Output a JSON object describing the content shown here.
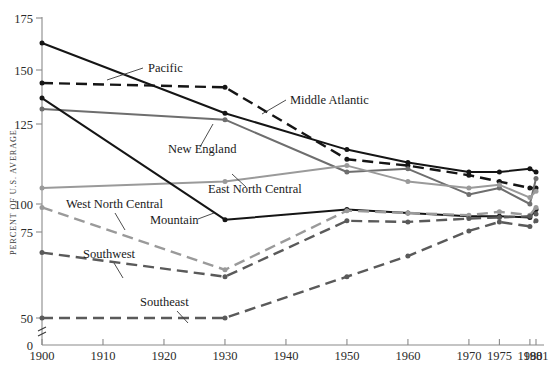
{
  "chart_data": {
    "type": "line",
    "title": "",
    "xlabel": "",
    "ylabel": "PERCENT OF U.S. AVERAGE",
    "x": [
      1900,
      1910,
      1920,
      1930,
      1940,
      1950,
      1960,
      1970,
      1975,
      1980,
      1981
    ],
    "xtick_labels": [
      "1900",
      "1910",
      "1920",
      "1930",
      "1940",
      "1950",
      "1960",
      "1970",
      "1975",
      "1980",
      "1981"
    ],
    "ytick_labels": [
      "0",
      "50",
      "75",
      "100",
      "125",
      "150",
      "175"
    ],
    "ytick_values": [
      0,
      50,
      75,
      100,
      125,
      150,
      175
    ],
    "ylim": [
      44,
      175
    ],
    "axis_break": true,
    "grid": false,
    "legend": "inline-annotations",
    "series": [
      {
        "name": "Pacific",
        "color": "#151515",
        "style": "solid",
        "x": [
          1900,
          1930,
          1950,
          1960,
          1970,
          1975,
          1980,
          1981
        ],
        "values": [
          163,
          130,
          117,
          113,
          110,
          110,
          111,
          110
        ]
      },
      {
        "name": "Middle Atlantic",
        "color": "#151515",
        "style": "dashed",
        "x": [
          1900,
          1930,
          1950,
          1960,
          1970,
          1975,
          1980,
          1981
        ],
        "values": [
          144,
          142,
          114,
          112,
          109,
          107,
          105,
          105
        ]
      },
      {
        "name": "New England",
        "color": "#6e6e6e",
        "style": "solid",
        "x": [
          1900,
          1930,
          1950,
          1960,
          1970,
          1975,
          1980,
          1981
        ],
        "values": [
          132,
          127,
          110,
          111,
          103,
          105,
          100,
          108
        ]
      },
      {
        "name": "East North Central",
        "color": "#9a9a9a",
        "style": "solid",
        "x": [
          1900,
          1930,
          1950,
          1960,
          1970,
          1975,
          1980,
          1981
        ],
        "values": [
          105,
          107,
          112,
          107,
          105,
          106,
          102,
          104
        ]
      },
      {
        "name": "Mountain",
        "color": "#151515",
        "style": "solid",
        "x": [
          1900,
          1930,
          1950,
          1960,
          1970,
          1975,
          1980,
          1981
        ],
        "values": [
          137,
          86,
          95,
          92,
          89,
          89,
          88,
          95
        ]
      },
      {
        "name": "West North Central",
        "color": "#9a9a9a",
        "style": "dashed",
        "x": [
          1900,
          1930,
          1950,
          1960,
          1970,
          1975,
          1980,
          1981
        ],
        "values": [
          97,
          64,
          94,
          92,
          90,
          93,
          90,
          97
        ]
      },
      {
        "name": "Southwest",
        "color": "#5a5a5a",
        "style": "dashed",
        "x": [
          1900,
          1930,
          1950,
          1960,
          1970,
          1975,
          1980,
          1981
        ],
        "values": [
          69,
          62,
          85,
          84,
          87,
          88,
          89,
          91
        ]
      },
      {
        "name": "Southeast",
        "color": "#5a5a5a",
        "style": "dashed",
        "x": [
          1900,
          1930,
          1950,
          1960,
          1970,
          1975,
          1980,
          1981
        ],
        "values": [
          47,
          49,
          62,
          68,
          76,
          84,
          80,
          85
        ]
      }
    ],
    "annotations": [
      {
        "label": "Pacific",
        "text_x": 148,
        "text_y": 72,
        "leader": [
          143,
          68,
          107,
          80
        ]
      },
      {
        "label": "Middle Atlantic",
        "text_x": 290,
        "text_y": 104,
        "leader": [
          286,
          100,
          262,
          114
        ]
      },
      {
        "label": "New England",
        "text_x": 168,
        "text_y": 153,
        "leader": [
          200,
          147,
          213,
          124
        ]
      },
      {
        "label": "East North Central",
        "text_x": 208,
        "text_y": 193,
        "leader": [
          246,
          187,
          232,
          174
        ]
      },
      {
        "label": "West North Central",
        "text_x": 66,
        "text_y": 208,
        "leader": [
          115,
          213,
          125,
          230
        ]
      },
      {
        "label": "Mountain",
        "text_x": 150,
        "text_y": 224,
        "leader": [
          198,
          219,
          214,
          213
        ]
      },
      {
        "label": "Southwest",
        "text_x": 83,
        "text_y": 258,
        "leader": [
          114,
          263,
          123,
          278
        ]
      },
      {
        "label": "Southeast",
        "text_x": 140,
        "text_y": 306,
        "leader": [
          177,
          311,
          188,
          323
        ]
      }
    ]
  }
}
